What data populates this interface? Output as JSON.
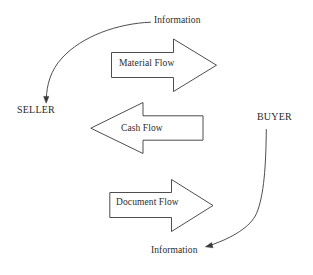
{
  "diagram": {
    "stroke_color": "#3a3a3a",
    "fill_color": "#ffffff",
    "text_color": "#2b2b2b",
    "background": "#ffffff",
    "nodes": [
      {
        "id": "seller",
        "label": "SELLER",
        "x": 17,
        "y": 104
      },
      {
        "id": "buyer",
        "label": "BUYER",
        "x": 257,
        "y": 111
      }
    ],
    "flows": [
      {
        "id": "material-flow",
        "label": "Material Flow",
        "direction": "right",
        "from": "seller",
        "to": "buyer",
        "shape": "block-arrow"
      },
      {
        "id": "cash-flow",
        "label": "Cash Flow",
        "direction": "left",
        "from": "buyer",
        "to": "seller",
        "shape": "block-arrow"
      },
      {
        "id": "document-flow",
        "label": "Document Flow",
        "direction": "right",
        "from": "seller",
        "to": "buyer",
        "shape": "block-arrow"
      }
    ],
    "information_arrows": [
      {
        "id": "information-to-seller",
        "label": "Information",
        "direction": "left-down",
        "target": "seller"
      },
      {
        "id": "information-from-buyer",
        "label": "Information",
        "direction": "left-down",
        "target": "information-bottom"
      }
    ]
  }
}
